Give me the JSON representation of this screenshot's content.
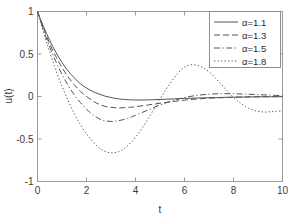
{
  "chart_data": {
    "type": "line",
    "title": "",
    "xlabel": "t",
    "ylabel": "u(t)",
    "xlim": [
      0,
      10
    ],
    "ylim": [
      -1,
      1
    ],
    "grid": false,
    "legend_position": "upper right",
    "xticks": [
      "0",
      "2",
      "4",
      "6",
      "8",
      "10"
    ],
    "xtick_values": [
      0,
      2,
      4,
      6,
      8,
      10
    ],
    "yticks": [
      "1",
      "0.5",
      "0",
      "-0.5",
      "-1"
    ],
    "ytick_values": [
      1,
      0.5,
      0,
      -0.5,
      -1
    ],
    "series": [
      {
        "name": "α=1.1",
        "linestyle": "solid",
        "color": "#555555",
        "x": [
          0,
          0.25,
          0.5,
          0.75,
          1,
          1.25,
          1.5,
          1.75,
          2,
          2.25,
          2.5,
          2.75,
          3,
          3.25,
          3.5,
          3.75,
          4,
          4.5,
          5,
          5.5,
          6,
          6.5,
          7,
          7.5,
          8,
          8.5,
          9,
          9.5,
          10
        ],
        "y": [
          1,
          0.82,
          0.66,
          0.52,
          0.4,
          0.3,
          0.22,
          0.15,
          0.1,
          0.06,
          0.03,
          0.005,
          -0.012,
          -0.026,
          -0.034,
          -0.039,
          -0.041,
          -0.04,
          -0.035,
          -0.029,
          -0.023,
          -0.018,
          -0.014,
          -0.011,
          -0.008,
          -0.006,
          -0.004,
          -0.003,
          -0.002
        ]
      },
      {
        "name": "α=1.3",
        "linestyle": "dashed",
        "color": "#555555",
        "x": [
          0,
          0.25,
          0.5,
          0.75,
          1,
          1.25,
          1.5,
          1.75,
          2,
          2.25,
          2.5,
          2.75,
          3,
          3.25,
          3.5,
          3.75,
          4,
          4.5,
          5,
          5.5,
          6,
          6.5,
          7,
          7.5,
          8,
          8.5,
          9,
          9.5,
          10
        ],
        "y": [
          1,
          0.8,
          0.62,
          0.47,
          0.34,
          0.23,
          0.14,
          0.06,
          0.0,
          -0.05,
          -0.09,
          -0.115,
          -0.128,
          -0.133,
          -0.132,
          -0.127,
          -0.12,
          -0.1,
          -0.08,
          -0.06,
          -0.043,
          -0.03,
          -0.02,
          -0.014,
          -0.009,
          -0.005,
          -0.003,
          -0.002,
          -0.001
        ]
      },
      {
        "name": "α=1.5",
        "linestyle": "dashdot",
        "color": "#555555",
        "x": [
          0,
          0.25,
          0.5,
          0.75,
          1,
          1.25,
          1.5,
          1.75,
          2,
          2.25,
          2.5,
          2.75,
          3,
          3.25,
          3.5,
          3.75,
          4,
          4.5,
          5,
          5.5,
          6,
          6.5,
          7,
          7.5,
          8,
          8.5,
          9,
          9.5,
          10
        ],
        "y": [
          1,
          0.78,
          0.58,
          0.41,
          0.26,
          0.13,
          0.02,
          -0.07,
          -0.15,
          -0.21,
          -0.26,
          -0.285,
          -0.293,
          -0.288,
          -0.272,
          -0.25,
          -0.222,
          -0.16,
          -0.1,
          -0.05,
          -0.012,
          0.013,
          0.027,
          0.033,
          0.032,
          0.028,
          0.022,
          0.016,
          0.01
        ]
      },
      {
        "name": "α=1.8",
        "linestyle": "dotted",
        "color": "#555555",
        "x": [
          0,
          0.25,
          0.5,
          0.75,
          1,
          1.25,
          1.5,
          1.75,
          2,
          2.25,
          2.5,
          2.75,
          3,
          3.25,
          3.5,
          3.75,
          4,
          4.25,
          4.5,
          4.75,
          5,
          5.25,
          5.5,
          5.75,
          6,
          6.25,
          6.5,
          6.75,
          7,
          7.25,
          7.5,
          7.75,
          8,
          8.25,
          8.5,
          8.75,
          9,
          9.25,
          9.5,
          9.75,
          10
        ],
        "y": [
          1,
          0.75,
          0.52,
          0.31,
          0.12,
          -0.05,
          -0.2,
          -0.33,
          -0.44,
          -0.53,
          -0.6,
          -0.645,
          -0.662,
          -0.655,
          -0.62,
          -0.56,
          -0.48,
          -0.38,
          -0.27,
          -0.15,
          -0.03,
          0.085,
          0.19,
          0.28,
          0.345,
          0.372,
          0.368,
          0.34,
          0.29,
          0.22,
          0.145,
          0.065,
          -0.01,
          -0.07,
          -0.12,
          -0.155,
          -0.175,
          -0.183,
          -0.18,
          -0.175,
          -0.168
        ]
      }
    ]
  },
  "legend": {
    "entries": [
      {
        "label": "α=1.1"
      },
      {
        "label": "α=1.3"
      },
      {
        "label": "α=1.5"
      },
      {
        "label": "α=1.8"
      }
    ]
  },
  "axes": {
    "x_title": "t",
    "y_title": "u(t)"
  }
}
